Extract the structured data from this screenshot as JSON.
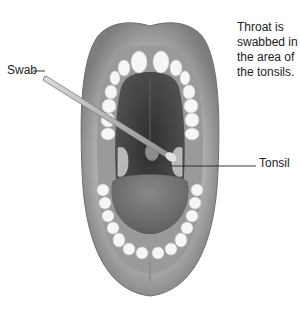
{
  "figure": {
    "labels": {
      "swab": "Swab",
      "tonsil": "Tonsil",
      "note_lines": [
        "Throat is",
        "swabbed in",
        "the area of",
        "the tonsils."
      ]
    },
    "colors": {
      "lip_outer": "#8a8a8a",
      "lip_inner": "#a9a9a9",
      "gum": "#9c9c9c",
      "oral_cavity": "#4a4a4a",
      "palate": "#3d3d3d",
      "tongue": "#6e6e6e",
      "tooth": "#f5f5f5",
      "tonsil": "#b5b5b5",
      "swab": "#bdbdbd",
      "text": "#222222",
      "leader_line": "#222222"
    }
  }
}
